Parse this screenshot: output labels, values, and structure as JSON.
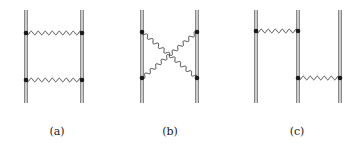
{
  "figure": {
    "panels": [
      {
        "id": "a",
        "label": "(a)",
        "description": "ladder diagram: two parallel double lines with two horizontal wavy exchange lines",
        "label_x": 57,
        "fermion_lines_x": [
          26,
          82
        ],
        "exchanges": [
          {
            "from": [
              26,
              33
            ],
            "to": [
              82,
              33
            ]
          },
          {
            "from": [
              26,
              80
            ],
            "to": [
              82,
              80
            ]
          }
        ]
      },
      {
        "id": "b",
        "label": "(b)",
        "description": "crossed diagram: two parallel double lines with two crossing wavy exchange lines",
        "label_x": 170,
        "fermion_lines_x": [
          142,
          197
        ],
        "exchanges": [
          {
            "from": [
              142,
              32
            ],
            "to": [
              197,
              78
            ]
          },
          {
            "from": [
              142,
              78
            ],
            "to": [
              197,
              32
            ]
          }
        ]
      },
      {
        "id": "c",
        "label": "(c)",
        "description": "three parallel double lines with staggered wavy exchanges",
        "label_x": 297,
        "fermion_lines_x": [
          256,
          298,
          340
        ],
        "exchanges": [
          {
            "from": [
              256,
              31
            ],
            "to": [
              298,
              31
            ]
          },
          {
            "from": [
              298,
              78
            ],
            "to": [
              340,
              78
            ]
          }
        ]
      }
    ],
    "line_top": 10,
    "line_bottom": 103,
    "colors": {
      "line": "#555555",
      "wave": "#333333",
      "vertex": "#1a1a1a"
    }
  }
}
